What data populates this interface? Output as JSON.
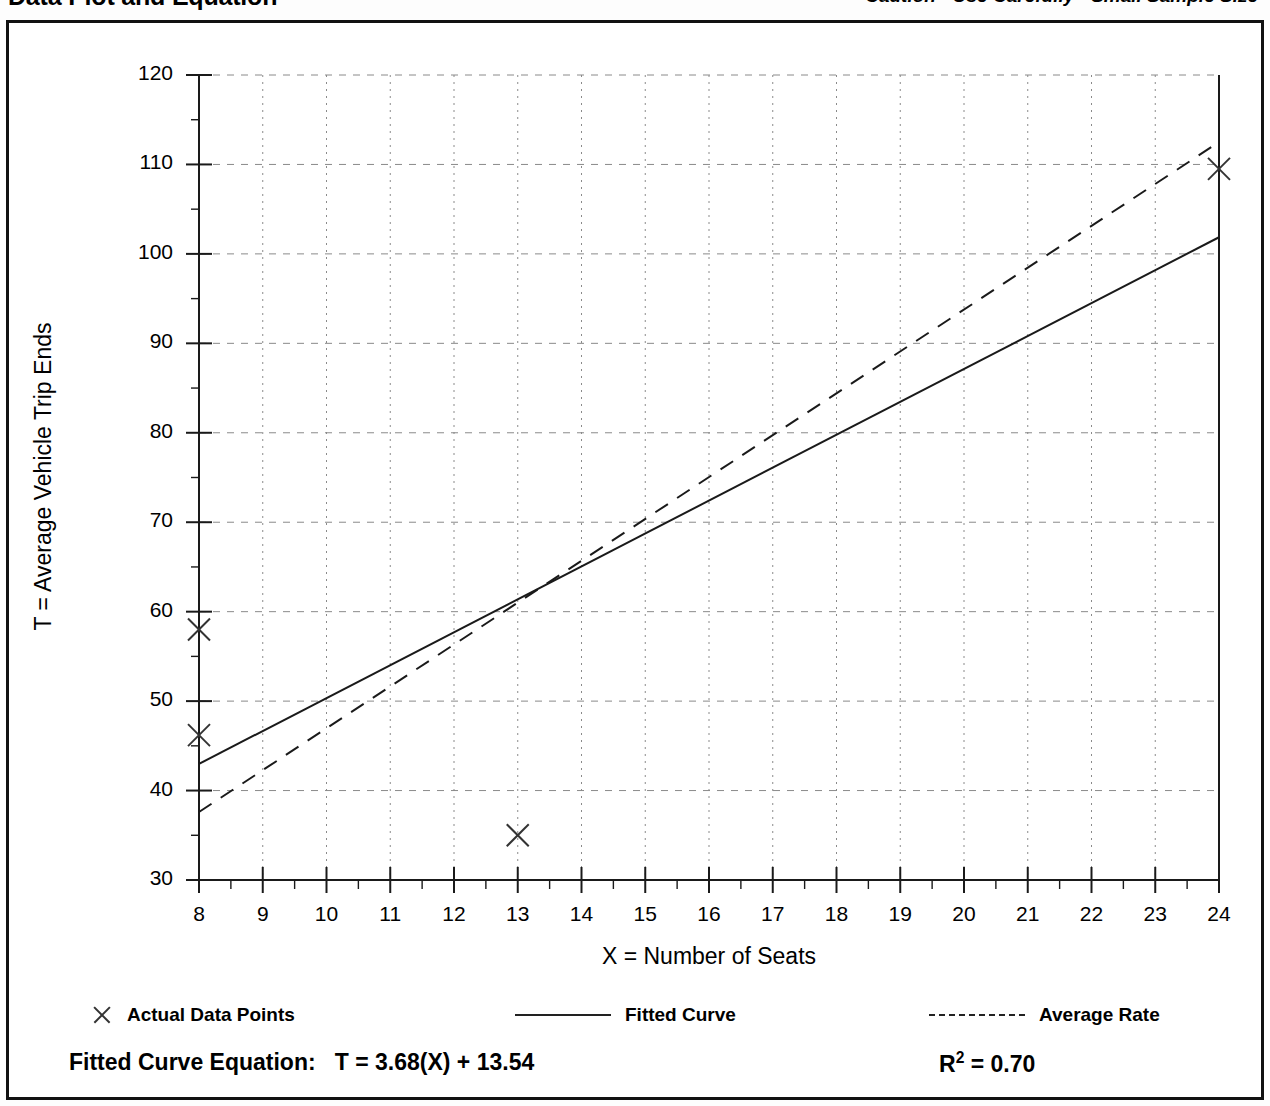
{
  "header": {
    "title": "Data Plot and Equation",
    "caution": "Caution - Use Carefully - Small Sample Size"
  },
  "footer": {
    "equation_label": "Fitted Curve Equation:",
    "equation": "T = 3.68(X) + 13.54",
    "r2_label": "R",
    "r2_exp": "2",
    "r2_value": "= 0.70"
  },
  "legend": {
    "data_points": "Actual Data Points",
    "fitted_curve": "Fitted Curve",
    "average_rate": "Average Rate"
  },
  "chart_data": {
    "type": "scatter",
    "title": "Data Plot and Equation",
    "xlabel": "X = Number of Seats",
    "ylabel": "T = Average Vehicle Trip Ends",
    "xlim": [
      8,
      24
    ],
    "ylim": [
      30,
      120
    ],
    "xticks": [
      8,
      9,
      10,
      11,
      12,
      13,
      14,
      15,
      16,
      17,
      18,
      19,
      20,
      21,
      22,
      23,
      24
    ],
    "yticks": [
      30,
      40,
      50,
      60,
      70,
      80,
      90,
      100,
      110,
      120
    ],
    "xtick_labels": [
      "8",
      "9",
      "10",
      "11",
      "12",
      "13",
      "14",
      "15",
      "16",
      "17",
      "18",
      "19",
      "20",
      "21",
      "22",
      "23",
      "24"
    ],
    "ytick_labels": [
      "30",
      "40",
      "50",
      "60",
      "70",
      "80",
      "90",
      "100",
      "110",
      "120"
    ],
    "x_minor_step": 0.5,
    "y_minor_step": 5,
    "grid": true,
    "grid_style": {
      "horizontal": "dashed",
      "vertical": "dotted"
    },
    "legend_position": "below-plot",
    "points": [
      {
        "x": 8,
        "y": 58.0
      },
      {
        "x": 8,
        "y": 46.2
      },
      {
        "x": 13,
        "y": 35.0
      },
      {
        "x": 24,
        "y": 109.5
      }
    ],
    "series": [
      {
        "name": "Fitted Curve",
        "type": "line",
        "style": "solid",
        "equation": "T = 3.68(X) + 13.54",
        "slope": 3.68,
        "intercept": 13.54,
        "r_squared": 0.7,
        "endpoints": [
          {
            "x": 8,
            "y": 42.98
          },
          {
            "x": 24,
            "y": 101.86
          }
        ]
      },
      {
        "name": "Average Rate",
        "type": "line",
        "style": "dashed",
        "endpoints": [
          {
            "x": 8,
            "y": 37.6
          },
          {
            "x": 24,
            "y": 112.5
          }
        ]
      }
    ],
    "marker": "x",
    "colors": {
      "axis": "#1a1a1a",
      "grid": "#8a8a8a",
      "fitted_curve": "#1a1a1a",
      "average_rate": "#1a1a1a",
      "marker": "#333333",
      "background": "#ffffff"
    }
  }
}
